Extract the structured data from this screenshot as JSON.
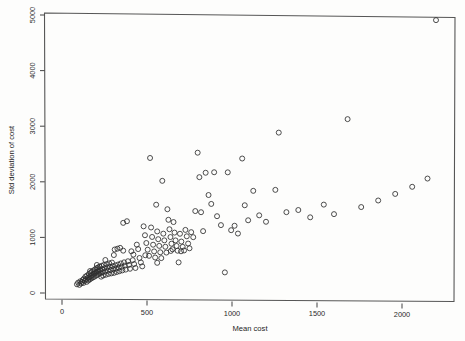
{
  "figure": {
    "name": "scatter-plot-mean-cost-vs-sd",
    "background": "#fdfdfc",
    "foreground": "#2e2e2e"
  },
  "chart_data": {
    "type": "scatter",
    "title": "",
    "subtitle": "",
    "xlabel": "Mean cost",
    "ylabel": "Std deviation of cost",
    "xlim": [
      -60,
      2330
    ],
    "ylim": [
      -120,
      5080
    ],
    "xticks": [
      0,
      500,
      1000,
      1500,
      2000
    ],
    "xticklabels": [
      "0",
      "500",
      "1000",
      "1500",
      "2000"
    ],
    "yticks": [
      0,
      1000,
      2000,
      3000,
      4000,
      5000
    ],
    "yticklabels": [
      "0",
      "1000",
      "2000",
      "3000",
      "4000",
      "5000"
    ],
    "grid": false,
    "legend": null,
    "marker": "open-circle",
    "marker_size": 2.5,
    "marker_color": "#2e2e2e",
    "frame": "box",
    "n_points": 172,
    "annotations": [],
    "points": [
      [
        88,
        160
      ],
      [
        95,
        190
      ],
      [
        102,
        150
      ],
      [
        108,
        215
      ],
      [
        112,
        175
      ],
      [
        118,
        205
      ],
      [
        122,
        240
      ],
      [
        126,
        185
      ],
      [
        130,
        265
      ],
      [
        134,
        225
      ],
      [
        138,
        300
      ],
      [
        141,
        250
      ],
      [
        145,
        205
      ],
      [
        148,
        320
      ],
      [
        152,
        275
      ],
      [
        155,
        230
      ],
      [
        158,
        345
      ],
      [
        161,
        290
      ],
      [
        164,
        250
      ],
      [
        167,
        365
      ],
      [
        170,
        310
      ],
      [
        173,
        270
      ],
      [
        176,
        390
      ],
      [
        179,
        330
      ],
      [
        182,
        285
      ],
      [
        185,
        410
      ],
      [
        188,
        350
      ],
      [
        191,
        300
      ],
      [
        194,
        430
      ],
      [
        197,
        370
      ],
      [
        200,
        318
      ],
      [
        203,
        450
      ],
      [
        206,
        390
      ],
      [
        209,
        335
      ],
      [
        212,
        465
      ],
      [
        215,
        405
      ],
      [
        218,
        350
      ],
      [
        221,
        480
      ],
      [
        224,
        420
      ],
      [
        227,
        365
      ],
      [
        230,
        300
      ],
      [
        233,
        495
      ],
      [
        236,
        435
      ],
      [
        239,
        380
      ],
      [
        242,
        320
      ],
      [
        246,
        510
      ],
      [
        250,
        450
      ],
      [
        254,
        395
      ],
      [
        258,
        335
      ],
      [
        262,
        525
      ],
      [
        266,
        465
      ],
      [
        270,
        410
      ],
      [
        274,
        350
      ],
      [
        278,
        540
      ],
      [
        282,
        478
      ],
      [
        286,
        420
      ],
      [
        290,
        360
      ],
      [
        294,
        555
      ],
      [
        298,
        490
      ],
      [
        302,
        435
      ],
      [
        306,
        370
      ],
      [
        310,
        790
      ],
      [
        314,
        505
      ],
      [
        318,
        450
      ],
      [
        322,
        385
      ],
      [
        326,
        805
      ],
      [
        330,
        520
      ],
      [
        334,
        465
      ],
      [
        338,
        400
      ],
      [
        342,
        820
      ],
      [
        346,
        540
      ],
      [
        350,
        480
      ],
      [
        355,
        415
      ],
      [
        360,
        1270
      ],
      [
        365,
        560
      ],
      [
        370,
        500
      ],
      [
        375,
        430
      ],
      [
        382,
        1300
      ],
      [
        388,
        580
      ],
      [
        394,
        515
      ],
      [
        400,
        445
      ],
      [
        408,
        760
      ],
      [
        416,
        600
      ],
      [
        424,
        530
      ],
      [
        432,
        460
      ],
      [
        440,
        880
      ],
      [
        448,
        800
      ],
      [
        456,
        640
      ],
      [
        464,
        560
      ],
      [
        472,
        490
      ],
      [
        480,
        1210
      ],
      [
        488,
        1050
      ],
      [
        496,
        910
      ],
      [
        504,
        790
      ],
      [
        512,
        680
      ],
      [
        518,
        2440
      ],
      [
        524,
        1190
      ],
      [
        530,
        1020
      ],
      [
        536,
        880
      ],
      [
        542,
        760
      ],
      [
        548,
        650
      ],
      [
        554,
        1600
      ],
      [
        560,
        1120
      ],
      [
        566,
        980
      ],
      [
        572,
        860
      ],
      [
        578,
        745
      ],
      [
        584,
        640
      ],
      [
        590,
        2030
      ],
      [
        596,
        1080
      ],
      [
        602,
        960
      ],
      [
        608,
        845
      ],
      [
        614,
        740
      ],
      [
        620,
        1520
      ],
      [
        626,
        1330
      ],
      [
        632,
        1160
      ],
      [
        638,
        1020
      ],
      [
        644,
        900
      ],
      [
        650,
        800
      ],
      [
        656,
        1290
      ],
      [
        662,
        1100
      ],
      [
        668,
        960
      ],
      [
        674,
        860
      ],
      [
        680,
        775
      ],
      [
        686,
        565
      ],
      [
        694,
        1080
      ],
      [
        702,
        940
      ],
      [
        710,
        845
      ],
      [
        718,
        780
      ],
      [
        726,
        1150
      ],
      [
        734,
        1035
      ],
      [
        742,
        905
      ],
      [
        750,
        820
      ],
      [
        760,
        1110
      ],
      [
        772,
        1020
      ],
      [
        784,
        1490
      ],
      [
        798,
        2540
      ],
      [
        808,
        2100
      ],
      [
        818,
        1470
      ],
      [
        830,
        1130
      ],
      [
        845,
        2180
      ],
      [
        862,
        1780
      ],
      [
        878,
        1620
      ],
      [
        895,
        2190
      ],
      [
        912,
        1400
      ],
      [
        935,
        1240
      ],
      [
        958,
        390
      ],
      [
        975,
        2190
      ],
      [
        995,
        1150
      ],
      [
        1015,
        1230
      ],
      [
        1035,
        1090
      ],
      [
        1060,
        2440
      ],
      [
        1075,
        1600
      ],
      [
        1095,
        1330
      ],
      [
        1125,
        1860
      ],
      [
        1160,
        1420
      ],
      [
        1200,
        1305
      ],
      [
        1255,
        1880
      ],
      [
        1275,
        2910
      ],
      [
        1320,
        1480
      ],
      [
        1390,
        1520
      ],
      [
        1460,
        1390
      ],
      [
        1540,
        1620
      ],
      [
        1600,
        1450
      ],
      [
        1680,
        3160
      ],
      [
        1760,
        1580
      ],
      [
        1860,
        1700
      ],
      [
        1960,
        1820
      ],
      [
        2060,
        1950
      ],
      [
        2150,
        2100
      ],
      [
        2200,
        4950
      ],
      [
        165,
        400
      ],
      [
        205,
        510
      ],
      [
        255,
        600
      ],
      [
        305,
        690
      ],
      [
        360,
        770
      ],
      [
        420,
        700
      ],
      [
        490,
        690
      ],
      [
        560,
        555
      ],
      [
        640,
        770
      ],
      [
        700,
        765
      ]
    ]
  }
}
